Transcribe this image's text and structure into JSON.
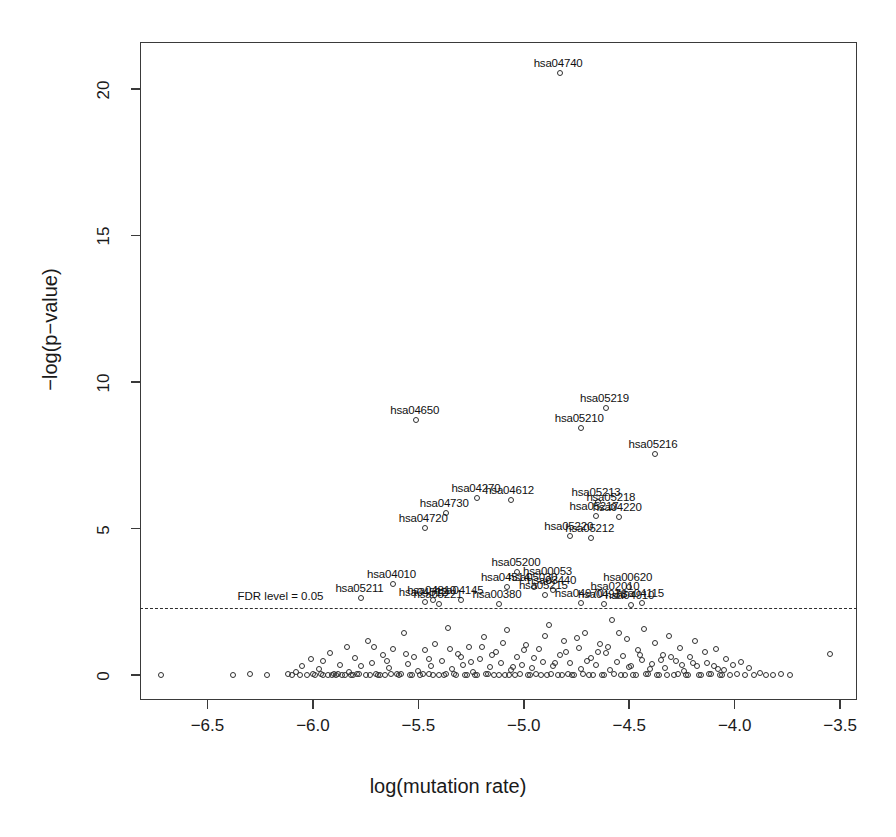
{
  "chart_data": {
    "type": "scatter",
    "title": "",
    "xlabel": "log(mutation rate)",
    "ylabel": "−log(p−value)",
    "xlim": [
      -6.82,
      -3.42
    ],
    "ylim": [
      -0.85,
      21.6
    ],
    "xticks": [
      -6.5,
      -6.0,
      -5.5,
      -5.0,
      -4.5,
      -4.0,
      -3.5
    ],
    "xticklabels": [
      "−6.5",
      "−6.0",
      "−5.5",
      "−5.0",
      "−4.5",
      "−4.0",
      "−3.5"
    ],
    "yticks": [
      0,
      5,
      10,
      15,
      20
    ],
    "yticklabels": [
      "0",
      "5",
      "10",
      "15",
      "20"
    ],
    "grid": false,
    "legend": null,
    "marker": "open-circle",
    "annotations": [
      {
        "text": "FDR level = 0.05",
        "x": -6.13,
        "y": 2.62
      }
    ],
    "threshold_line": {
      "label": "FDR level = 0.05",
      "y": 2.28,
      "style": "dashed"
    },
    "labeled_points": [
      {
        "label": "hsa04740",
        "x": -4.83,
        "y": 20.55
      },
      {
        "label": "hsa05219",
        "x": -4.61,
        "y": 9.12
      },
      {
        "label": "hsa04650",
        "x": -5.51,
        "y": 8.72
      },
      {
        "label": "hsa05210",
        "x": -4.73,
        "y": 8.42
      },
      {
        "label": "hsa05216",
        "x": -4.38,
        "y": 7.55
      },
      {
        "label": "hsa04270",
        "x": -5.22,
        "y": 6.05
      },
      {
        "label": "hsa04612",
        "x": -5.06,
        "y": 5.98
      },
      {
        "label": "hsa05213",
        "x": -4.65,
        "y": 5.9
      },
      {
        "label": "hsa05218",
        "x": -4.58,
        "y": 5.72
      },
      {
        "label": "hsa04730",
        "x": -5.37,
        "y": 5.52
      },
      {
        "label": "hsa05217",
        "x": -4.66,
        "y": 5.42
      },
      {
        "label": "hsa04220",
        "x": -4.55,
        "y": 5.38
      },
      {
        "label": "hsa04720",
        "x": -5.47,
        "y": 5.02
      },
      {
        "label": "hsa05220",
        "x": -4.78,
        "y": 4.75
      },
      {
        "label": "hsa05212",
        "x": -4.68,
        "y": 4.68
      },
      {
        "label": "hsa05200",
        "x": -5.03,
        "y": 3.52
      },
      {
        "label": "hsa04010",
        "x": -5.62,
        "y": 3.1
      },
      {
        "label": "hsa00053",
        "x": -4.88,
        "y": 3.22
      },
      {
        "label": "hsa04514",
        "x": -5.08,
        "y": 3.02
      },
      {
        "label": "hsa05030",
        "x": -4.95,
        "y": 3.02
      },
      {
        "label": "hsa03440",
        "x": -4.86,
        "y": 2.92
      },
      {
        "label": "hsa00620",
        "x": -4.5,
        "y": 3.0
      },
      {
        "label": "hsa05215",
        "x": -4.9,
        "y": 2.72
      },
      {
        "label": "hsa02010",
        "x": -4.56,
        "y": 2.7
      },
      {
        "label": "hsa05211",
        "x": -5.77,
        "y": 2.62
      },
      {
        "label": "hsa04810",
        "x": -5.43,
        "y": 2.55
      },
      {
        "label": "hsa04145",
        "x": -5.3,
        "y": 2.55
      },
      {
        "label": "hsa04512",
        "x": -5.47,
        "y": 2.48
      },
      {
        "label": "hsa05221",
        "x": -5.4,
        "y": 2.44
      },
      {
        "label": "hsa00380",
        "x": -5.12,
        "y": 2.44
      },
      {
        "label": "hsa04970",
        "x": -4.73,
        "y": 2.46
      },
      {
        "label": "hsa04978",
        "x": -4.62,
        "y": 2.44
      },
      {
        "label": "hsa04115",
        "x": -4.44,
        "y": 2.46
      },
      {
        "label": "hsa04910",
        "x": -4.49,
        "y": 2.4
      }
    ],
    "background_points": [
      [
        -6.72,
        0.02
      ],
      [
        -6.38,
        0.02
      ],
      [
        -6.3,
        0.03
      ],
      [
        -6.22,
        0.02
      ],
      [
        -6.12,
        0.05
      ],
      [
        -6.1,
        0.02
      ],
      [
        -6.08,
        0.1
      ],
      [
        -6.06,
        0.02
      ],
      [
        -6.05,
        0.3
      ],
      [
        -6.03,
        0.02
      ],
      [
        -6.01,
        0.55
      ],
      [
        -6.0,
        0.04
      ],
      [
        -5.99,
        0.02
      ],
      [
        -5.97,
        0.22
      ],
      [
        -5.96,
        0.03
      ],
      [
        -5.95,
        0.48
      ],
      [
        -5.93,
        0.02
      ],
      [
        -5.92,
        0.75
      ],
      [
        -5.9,
        0.05
      ],
      [
        -5.89,
        0.02
      ],
      [
        -5.87,
        0.35
      ],
      [
        -5.86,
        0.02
      ],
      [
        -5.84,
        0.95
      ],
      [
        -5.83,
        0.12
      ],
      [
        -5.82,
        0.02
      ],
      [
        -5.8,
        0.58
      ],
      [
        -5.79,
        0.03
      ],
      [
        -5.77,
        0.3
      ],
      [
        -5.75,
        0.02
      ],
      [
        -5.74,
        1.18
      ],
      [
        -5.72,
        0.42
      ],
      [
        -5.7,
        0.05
      ],
      [
        -5.69,
        0.02
      ],
      [
        -5.67,
        0.68
      ],
      [
        -5.66,
        0.02
      ],
      [
        -5.64,
        0.25
      ],
      [
        -5.62,
        0.9
      ],
      [
        -5.6,
        0.03
      ],
      [
        -5.58,
        0.05
      ],
      [
        -5.57,
        1.42
      ],
      [
        -5.55,
        0.38
      ],
      [
        -5.53,
        0.02
      ],
      [
        -5.52,
        0.62
      ],
      [
        -5.5,
        0.15
      ],
      [
        -5.49,
        0.02
      ],
      [
        -5.47,
        0.85
      ],
      [
        -5.45,
        0.03
      ],
      [
        -5.44,
        0.3
      ],
      [
        -5.42,
        1.05
      ],
      [
        -5.4,
        0.02
      ],
      [
        -5.39,
        0.48
      ],
      [
        -5.37,
        0.05
      ],
      [
        -5.36,
        1.62
      ],
      [
        -5.34,
        0.22
      ],
      [
        -5.32,
        0.02
      ],
      [
        -5.31,
        0.72
      ],
      [
        -5.29,
        0.35
      ],
      [
        -5.27,
        0.02
      ],
      [
        -5.26,
        0.95
      ],
      [
        -5.24,
        0.12
      ],
      [
        -5.23,
        0.02
      ],
      [
        -5.21,
        0.55
      ],
      [
        -5.19,
        1.3
      ],
      [
        -5.18,
        0.03
      ],
      [
        -5.16,
        0.28
      ],
      [
        -5.14,
        0.02
      ],
      [
        -5.13,
        0.78
      ],
      [
        -5.11,
        0.42
      ],
      [
        -5.09,
        0.02
      ],
      [
        -5.08,
        1.55
      ],
      [
        -5.06,
        0.18
      ],
      [
        -5.04,
        0.02
      ],
      [
        -5.03,
        0.62
      ],
      [
        -5.01,
        0.35
      ],
      [
        -4.99,
        1.02
      ],
      [
        -4.98,
        0.02
      ],
      [
        -4.96,
        0.25
      ],
      [
        -4.94,
        0.05
      ],
      [
        -4.93,
        0.88
      ],
      [
        -4.91,
        0.45
      ],
      [
        -4.89,
        0.02
      ],
      [
        -4.88,
        1.72
      ],
      [
        -4.86,
        0.32
      ],
      [
        -4.84,
        0.02
      ],
      [
        -4.83,
        0.68
      ],
      [
        -4.81,
        1.15
      ],
      [
        -4.79,
        0.05
      ],
      [
        -4.78,
        0.4
      ],
      [
        -4.76,
        0.02
      ],
      [
        -4.74,
        0.92
      ],
      [
        -4.73,
        0.22
      ],
      [
        -4.71,
        1.45
      ],
      [
        -4.69,
        0.02
      ],
      [
        -4.68,
        0.58
      ],
      [
        -4.66,
        0.35
      ],
      [
        -4.64,
        1.05
      ],
      [
        -4.63,
        0.02
      ],
      [
        -4.61,
        0.75
      ],
      [
        -4.59,
        0.18
      ],
      [
        -4.58,
        1.88
      ],
      [
        -4.56,
        0.45
      ],
      [
        -4.54,
        0.02
      ],
      [
        -4.53,
        0.65
      ],
      [
        -4.51,
        1.22
      ],
      [
        -4.49,
        0.3
      ],
      [
        -4.48,
        0.02
      ],
      [
        -4.46,
        0.85
      ],
      [
        -4.44,
        0.52
      ],
      [
        -4.43,
        1.58
      ],
      [
        -4.41,
        0.05
      ],
      [
        -4.39,
        0.38
      ],
      [
        -4.38,
        1.08
      ],
      [
        -4.36,
        0.02
      ],
      [
        -4.34,
        0.7
      ],
      [
        -4.33,
        0.25
      ],
      [
        -4.31,
        1.35
      ],
      [
        -4.29,
        0.02
      ],
      [
        -4.28,
        0.48
      ],
      [
        -4.26,
        0.92
      ],
      [
        -4.24,
        0.15
      ],
      [
        -4.23,
        0.02
      ],
      [
        -4.21,
        0.62
      ],
      [
        -4.19,
        1.15
      ],
      [
        -4.18,
        0.32
      ],
      [
        -4.16,
        0.02
      ],
      [
        -4.14,
        0.78
      ],
      [
        -4.13,
        0.42
      ],
      [
        -4.11,
        0.05
      ],
      [
        -4.09,
        0.88
      ],
      [
        -4.08,
        0.2
      ],
      [
        -4.06,
        0.02
      ],
      [
        -4.04,
        0.55
      ],
      [
        -4.02,
        0.02
      ],
      [
        -4.01,
        0.35
      ],
      [
        -3.99,
        0.05
      ],
      [
        -3.97,
        0.45
      ],
      [
        -3.95,
        0.02
      ],
      [
        -3.93,
        0.25
      ],
      [
        -3.91,
        0.02
      ],
      [
        -3.88,
        0.08
      ],
      [
        -3.85,
        0.02
      ],
      [
        -3.82,
        0.02
      ],
      [
        -3.78,
        0.05
      ],
      [
        -3.74,
        0.02
      ],
      [
        -3.55,
        0.72
      ],
      [
        -5.95,
        0.02
      ],
      [
        -5.91,
        0.02
      ],
      [
        -5.88,
        0.03
      ],
      [
        -5.85,
        0.02
      ],
      [
        -5.81,
        0.02
      ],
      [
        -5.78,
        0.03
      ],
      [
        -5.73,
        0.02
      ],
      [
        -5.68,
        0.02
      ],
      [
        -5.63,
        0.03
      ],
      [
        -5.59,
        0.02
      ],
      [
        -5.54,
        0.02
      ],
      [
        -5.48,
        0.03
      ],
      [
        -5.43,
        0.02
      ],
      [
        -5.38,
        0.02
      ],
      [
        -5.33,
        0.03
      ],
      [
        -5.28,
        0.02
      ],
      [
        -5.22,
        0.02
      ],
      [
        -5.17,
        0.03
      ],
      [
        -5.12,
        0.02
      ],
      [
        -5.07,
        0.02
      ],
      [
        -5.02,
        0.03
      ],
      [
        -4.97,
        0.02
      ],
      [
        -4.92,
        0.02
      ],
      [
        -4.87,
        0.03
      ],
      [
        -4.82,
        0.02
      ],
      [
        -4.77,
        0.02
      ],
      [
        -4.72,
        0.03
      ],
      [
        -4.67,
        0.02
      ],
      [
        -4.62,
        0.02
      ],
      [
        -4.57,
        0.03
      ],
      [
        -4.52,
        0.02
      ],
      [
        -4.47,
        0.02
      ],
      [
        -4.42,
        0.03
      ],
      [
        -4.37,
        0.02
      ],
      [
        -4.32,
        0.02
      ],
      [
        -4.27,
        0.03
      ],
      [
        -4.22,
        0.02
      ],
      [
        -4.17,
        0.02
      ],
      [
        -4.12,
        0.03
      ],
      [
        -4.07,
        0.02
      ],
      [
        -5.3,
        0.62
      ],
      [
        -5.25,
        0.45
      ],
      [
        -5.15,
        0.7
      ],
      [
        -5.05,
        0.28
      ],
      [
        -4.95,
        0.6
      ],
      [
        -4.85,
        0.4
      ],
      [
        -4.75,
        1.25
      ],
      [
        -4.65,
        0.8
      ],
      [
        -4.55,
        1.42
      ],
      [
        -4.45,
        0.68
      ],
      [
        -4.35,
        0.52
      ],
      [
        -4.25,
        0.35
      ],
      [
        -4.6,
        0.95
      ],
      [
        -4.5,
        0.28
      ],
      [
        -4.4,
        0.22
      ],
      [
        -4.7,
        0.48
      ],
      [
        -4.8,
        0.78
      ],
      [
        -4.9,
        1.32
      ],
      [
        -5.0,
        0.85
      ],
      [
        -5.1,
        1.1
      ],
      [
        -5.2,
        0.95
      ],
      [
        -5.35,
        0.88
      ],
      [
        -5.45,
        0.55
      ],
      [
        -5.56,
        0.72
      ],
      [
        -5.65,
        0.48
      ],
      [
        -5.71,
        0.95
      ],
      [
        -4.3,
        0.62
      ],
      [
        -4.2,
        0.42
      ],
      [
        -4.1,
        0.3
      ],
      [
        -4.05,
        0.18
      ]
    ]
  }
}
